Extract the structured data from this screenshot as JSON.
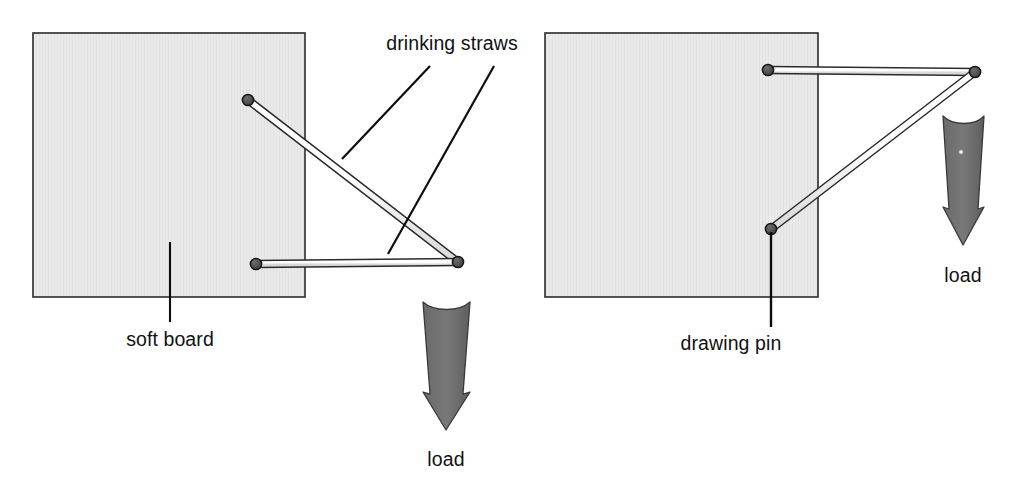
{
  "figure": {
    "background_color": "#ffffff",
    "board_fill": "#e9e9e9",
    "board_border_color": "#2b2b2b",
    "straw_fill": "#ffffff",
    "straw_outline": "#2a2a2a",
    "pin_color": "#4d4d4d",
    "pin_outline": "#1c1c1c",
    "arrow_color": "#6e6e6e",
    "arrow_outline": "#3a3a3a",
    "leader_color": "#0d0d0d",
    "text_color": "#111111"
  },
  "labels": {
    "drinking_straws": "drinking straws",
    "soft_board": "soft board",
    "drawing_pin": "drawing pin",
    "load_left": "load",
    "load_right": "load"
  },
  "left_panel": {
    "name": "left-arrangement",
    "board": {
      "x": 33,
      "y": 33,
      "width": 272,
      "height": 264
    },
    "pins": [
      {
        "name": "top-pin",
        "cx": 248,
        "cy": 100,
        "r": 5.5
      },
      {
        "name": "bottom-pin",
        "cx": 256,
        "cy": 264,
        "r": 5.5
      },
      {
        "name": "outer-joint-pin",
        "cx": 458,
        "cy": 262,
        "r": 5.5
      }
    ],
    "straws": [
      {
        "name": "diagonal-straw",
        "x1": 248,
        "y1": 100,
        "x2": 458,
        "y2": 262,
        "thickness": 7
      },
      {
        "name": "horizontal-straw",
        "x1": 256,
        "y1": 264,
        "x2": 458,
        "y2": 262,
        "thickness": 7
      }
    ],
    "load_arrow": {
      "x": 423,
      "y": 302,
      "width": 47,
      "height": 128,
      "direction": "down"
    },
    "load_label_pos": {
      "x": 446,
      "y": 466
    },
    "soft_board_leader": {
      "x1": 170,
      "y1": 242,
      "x2": 170,
      "y2": 322
    },
    "soft_board_label_pos": {
      "x": 156,
      "y": 346
    }
  },
  "right_panel": {
    "name": "right-arrangement",
    "board": {
      "x": 545,
      "y": 33,
      "width": 273,
      "height": 264
    },
    "pins": [
      {
        "name": "top-pin",
        "cx": 768,
        "cy": 70,
        "r": 5.5
      },
      {
        "name": "lower-pin",
        "cx": 771,
        "cy": 229,
        "r": 5.5
      },
      {
        "name": "outer-joint-pin",
        "cx": 975,
        "cy": 72,
        "r": 5.5
      }
    ],
    "straws": [
      {
        "name": "horizontal-straw",
        "x1": 768,
        "y1": 70,
        "x2": 975,
        "y2": 72,
        "thickness": 7
      },
      {
        "name": "diagonal-straw",
        "x1": 771,
        "y1": 229,
        "x2": 975,
        "y2": 72,
        "thickness": 7
      }
    ],
    "load_arrow": {
      "x": 943,
      "y": 116,
      "width": 41,
      "height": 129,
      "direction": "down"
    },
    "load_label_pos": {
      "x": 963,
      "y": 282
    },
    "drawing_pin_leader": {
      "x1": 771,
      "y1": 232,
      "x2": 771,
      "y2": 327
    },
    "drawing_pin_label_pos": {
      "x": 731,
      "y": 350
    }
  },
  "straw_leaders": [
    {
      "name": "leader-to-diagonal-straw",
      "x1": 430,
      "y1": 66,
      "x2": 342,
      "y2": 159
    },
    {
      "name": "leader-to-horizontal-straw",
      "x1": 494,
      "y1": 66,
      "x2": 388,
      "y2": 254
    }
  ],
  "straw_label_pos": {
    "x": 452,
    "y": 50
  }
}
